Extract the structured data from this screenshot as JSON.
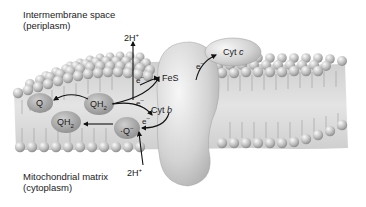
{
  "regions": {
    "top_line1": "Intermembrane space",
    "top_line2": "(periplasm)",
    "bottom_line1": "Mitochondrial matrix",
    "bottom_line2": "(cytoplasm)"
  },
  "molecules": {
    "q_upper": "Q",
    "qh2_upper": "QH",
    "qh2_upper_sub": "2",
    "qh2_lower": "QH",
    "qh2_lower_sub": "2",
    "q_radical": "Q",
    "q_radical_sup": "–",
    "q_radical_dot": "·",
    "fes": "FeS",
    "cyt_b": "Cyt",
    "cyt_b_italic": "b",
    "cyt_c": "Cyt",
    "cyt_c_italic": "c"
  },
  "protons": {
    "top": "2H",
    "top_sup": "+",
    "bottom": "2H",
    "bottom_sup": "+"
  },
  "electrons": {
    "symbol": "e",
    "sup": "–"
  },
  "colors": {
    "membrane_core": "#d6d6d6",
    "head_light": "#eeeeee",
    "head_dark": "#8f8f8f",
    "protein": "#c9c9c9",
    "quinone": "#9a9a9a",
    "arrow": "#111111"
  }
}
